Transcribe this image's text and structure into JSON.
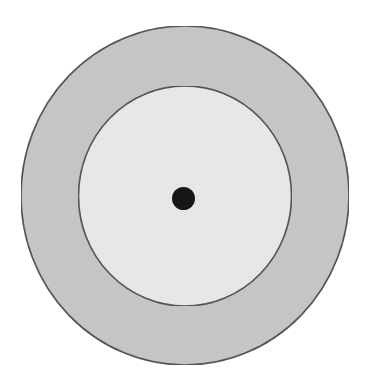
{
  "diagram": {
    "background": "#ffffff",
    "outer_circle": {
      "cx": 185,
      "cy": 195.5,
      "rx": 164,
      "ry": 169.5,
      "fill": "#c6c6c6",
      "stroke": "#4a4a4a"
    },
    "inner_circle": {
      "cx": 185,
      "cy": 196,
      "rx": 106.5,
      "ry": 110,
      "fill": "#e9e9e9",
      "stroke": "#4a4a4a"
    },
    "center_dot": {
      "cx": 183.5,
      "cy": 198.5,
      "r": 11.5,
      "fill": "#161616"
    }
  }
}
